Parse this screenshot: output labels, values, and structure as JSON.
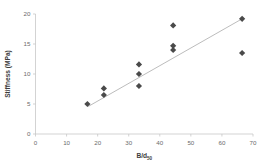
{
  "chart_data": {
    "type": "scatter",
    "title": "",
    "xlabel": "B/d50",
    "xlabel_base": "B/d",
    "xlabel_subscript": "50",
    "ylabel": "Stiffness (MPa)",
    "xlim": [
      0,
      70
    ],
    "ylim": [
      0,
      20
    ],
    "xticks": [
      0,
      10,
      20,
      30,
      40,
      50,
      60,
      70
    ],
    "yticks": [
      0,
      5,
      10,
      15,
      20
    ],
    "xtick_labels": [
      "0",
      "10",
      "20",
      "30",
      "40",
      "50",
      "60",
      "70"
    ],
    "ytick_labels": [
      "0",
      "5",
      "10",
      "15",
      "20"
    ],
    "grid": false,
    "legend": false,
    "marker": "diamond",
    "marker_color": "#4a4a4a",
    "points": [
      {
        "x": 16.7,
        "y": 5.0
      },
      {
        "x": 22.0,
        "y": 7.6
      },
      {
        "x": 22.0,
        "y": 6.5
      },
      {
        "x": 33.3,
        "y": 11.6
      },
      {
        "x": 33.3,
        "y": 10.0
      },
      {
        "x": 33.3,
        "y": 8.0
      },
      {
        "x": 44.3,
        "y": 18.1
      },
      {
        "x": 44.3,
        "y": 14.7
      },
      {
        "x": 44.3,
        "y": 14.0
      },
      {
        "x": 66.5,
        "y": 19.2
      },
      {
        "x": 66.5,
        "y": 13.5
      }
    ],
    "trendline": {
      "type": "linear",
      "color": "#b4b4b4",
      "x_start": 17.0,
      "y_start": 4.6,
      "x_end": 66.5,
      "y_end": 19.2
    }
  }
}
